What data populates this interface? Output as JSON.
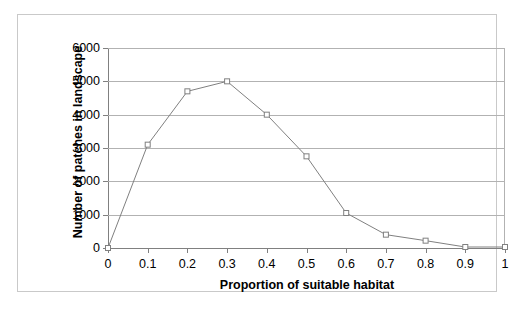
{
  "chart_data": {
    "type": "line",
    "title": "",
    "xlabel": "Proportion of suitable habitat",
    "ylabel": "Number of patches in landscape",
    "x": [
      0,
      0.1,
      0.2,
      0.3,
      0.4,
      0.5,
      0.6,
      0.7,
      0.8,
      0.9,
      1
    ],
    "values": [
      0,
      3100,
      4700,
      5000,
      4000,
      2750,
      1050,
      400,
      220,
      30,
      30
    ],
    "series": [
      {
        "name": "Number of patches in landscape",
        "values": [
          0,
          3100,
          4700,
          5000,
          4000,
          2750,
          1050,
          400,
          220,
          30,
          30
        ]
      }
    ],
    "xlim": [
      0,
      1
    ],
    "ylim": [
      0,
      6000
    ],
    "xticks": [
      0,
      0.1,
      0.2,
      0.3,
      0.4,
      0.5,
      0.6,
      0.7,
      0.8,
      0.9,
      1
    ],
    "xtick_labels": [
      "0",
      "0.1",
      "0.2",
      "0.3",
      "0.4",
      "0.5",
      "0.6",
      "0.7",
      "0.8",
      "0.9",
      "1"
    ],
    "yticks": [
      0,
      1000,
      2000,
      3000,
      4000,
      5000,
      6000
    ],
    "ytick_labels": [
      "0",
      "1000",
      "2000",
      "3000",
      "4000",
      "5000",
      "6000"
    ],
    "grid": "horizontal",
    "legend": "none",
    "marker": "open-square",
    "line_color": "#808080",
    "marker_edge_color": "#808080",
    "marker_face_color": "#ffffff",
    "grid_color": "#b2b2b2",
    "axis_color": "#808080",
    "background_color": "#ffffff"
  }
}
